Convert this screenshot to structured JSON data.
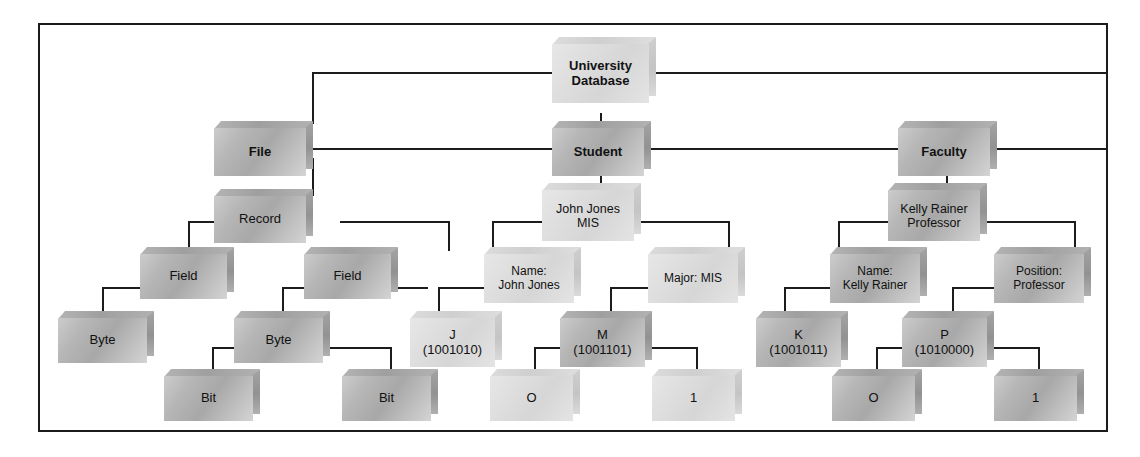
{
  "figure": {
    "border_color": "#1b1b1b",
    "background": "#ffffff",
    "line_color": "#1c1c1c"
  },
  "nodes": {
    "root": {
      "label": "University\nDatabase"
    },
    "file": {
      "label": "File"
    },
    "student": {
      "label": "Student"
    },
    "faculty": {
      "label": "Faculty"
    },
    "record": {
      "label": "Record"
    },
    "john_jones": {
      "label": "John Jones\nMIS"
    },
    "kelly_rainer": {
      "label": "Kelly Rainer\nProfessor"
    },
    "field_left": {
      "label": "Field"
    },
    "field_right": {
      "label": "Field"
    },
    "name_john": {
      "label": "Name:\nJohn Jones"
    },
    "major_mis": {
      "label": "Major: MIS"
    },
    "name_kelly": {
      "label": "Name:\nKelly Rainer"
    },
    "position_professor": {
      "label": "Position:\nProfessor"
    },
    "byte_left": {
      "label": "Byte"
    },
    "byte_right": {
      "label": "Byte"
    },
    "char_j": {
      "label": "J\n(1001010)"
    },
    "char_m": {
      "label": "M\n(1001101)"
    },
    "char_k": {
      "label": "K\n(1001011)"
    },
    "char_p": {
      "label": "P\n(1010000)"
    },
    "bit_left": {
      "label": "Bit"
    },
    "bit_right": {
      "label": "Bit"
    },
    "bit_mid_zero": {
      "label": "O"
    },
    "bit_mid_one": {
      "label": "1"
    },
    "bit_fac_zero": {
      "label": "O"
    },
    "bit_fac_one": {
      "label": "1"
    }
  }
}
